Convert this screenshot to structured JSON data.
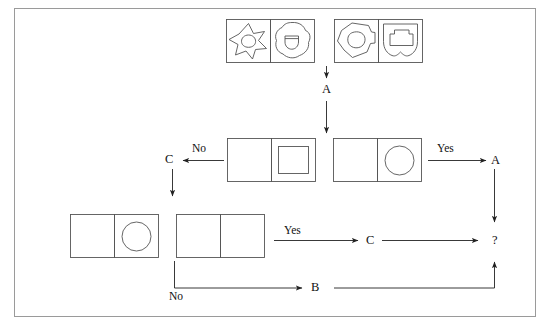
{
  "diagram": {
    "border_color": "#9a9a9a",
    "line_color": "#333333",
    "background": "#ffffff"
  },
  "top_row": {
    "group_left": {
      "cells": [
        {
          "name": "six-point-star-with-inner-blob",
          "shape": "star-6-with-inner-circle"
        },
        {
          "name": "blob-with-inner-cup",
          "shape": "blob-with-half-circle"
        }
      ]
    },
    "group_right": {
      "cells": [
        {
          "name": "polygon-with-inner-blob",
          "shape": "pentagon-blob-with-inner-circle"
        },
        {
          "name": "shield-with-inner-square",
          "shape": "shield-with-square"
        }
      ]
    }
  },
  "labels": {
    "a_top": "A",
    "no_left": "No",
    "c_left": "C",
    "yes_right": "Yes",
    "a_right": "A",
    "yes_bottom": "Yes",
    "c_bottom": "C",
    "no_bottom": "No",
    "b_bottom": "B",
    "question": "?"
  },
  "middle_row": {
    "left_pair": {
      "cells": [
        {
          "name": "empty-cell",
          "shape": "empty"
        },
        {
          "name": "square-cell",
          "shape": "square"
        }
      ]
    },
    "right_pair": {
      "cells": [
        {
          "name": "empty-cell",
          "shape": "empty"
        },
        {
          "name": "circle-cell",
          "shape": "circle"
        }
      ]
    }
  },
  "bottom_row": {
    "left_pair": {
      "cells": [
        {
          "name": "empty-cell",
          "shape": "empty"
        },
        {
          "name": "circle-cell",
          "shape": "circle"
        }
      ]
    },
    "right_pair": {
      "cells": [
        {
          "name": "empty-cell",
          "shape": "empty"
        },
        {
          "name": "empty-cell",
          "shape": "empty"
        }
      ]
    }
  },
  "connectors": [
    {
      "name": "arrow-top-to-a",
      "from": "top_row",
      "to": "a_top",
      "direction": "down"
    },
    {
      "name": "arrow-a-to-middle",
      "from": "a_top",
      "to": "middle_row",
      "direction": "down"
    },
    {
      "name": "arrow-middle-left-to-c",
      "label": "No",
      "direction": "left"
    },
    {
      "name": "arrow-c-down",
      "from": "c_left",
      "to": "bottom_row",
      "direction": "down"
    },
    {
      "name": "arrow-middle-right-to-a",
      "label": "Yes",
      "direction": "right"
    },
    {
      "name": "arrow-a-right-to-question",
      "direction": "down"
    },
    {
      "name": "arrow-bottom-yes-to-c",
      "label": "Yes",
      "direction": "right"
    },
    {
      "name": "arrow-c-to-question",
      "direction": "right"
    },
    {
      "name": "arrow-no-to-b",
      "label": "No",
      "direction": "right"
    },
    {
      "name": "arrow-b-to-question",
      "direction": "up"
    }
  ]
}
